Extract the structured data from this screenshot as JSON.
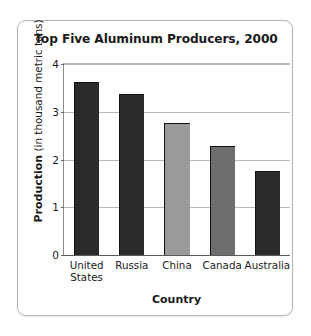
{
  "chart_data": {
    "type": "bar",
    "title": "Top Five Aluminum Producers, 2000",
    "xlabel": "Country",
    "ylabel": "Production (in thousand metric tons)",
    "ylabel_strong": "Production",
    "ylabel_rest": " (in thousand metric tons)",
    "categories": [
      "United States",
      "Russia",
      "China",
      "Canada",
      "Australia"
    ],
    "category_lines": [
      [
        "United",
        "States"
      ],
      [
        "Russia"
      ],
      [
        "China"
      ],
      [
        "Canada"
      ],
      [
        "Australia"
      ]
    ],
    "values": [
      3.63,
      3.38,
      2.76,
      2.28,
      1.76
    ],
    "bar_colors": [
      "#2b2b2b",
      "#2b2b2b",
      "#9a9a9a",
      "#6e6e6e",
      "#2b2b2b"
    ],
    "ylim": [
      0,
      4
    ],
    "yticks": [
      0,
      1,
      2,
      3,
      4
    ],
    "ytick_labels": [
      "0",
      "1",
      "2",
      "3",
      "4"
    ],
    "grid": true,
    "legend": null,
    "background_color": "#ffffff",
    "frame_color": "#b4b4b4",
    "gridline_color": "#b9b9b9",
    "axis_color": "#5a5a5a"
  }
}
